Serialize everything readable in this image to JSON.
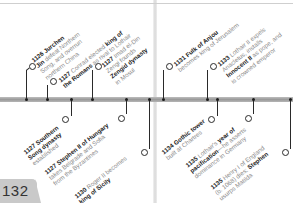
{
  "page": {
    "number": "132"
  },
  "timeline": {
    "bar_color": "#a8a8a8",
    "marker_color": "#1a1a1a"
  },
  "events": [
    {
      "id": "e1",
      "year": "1126",
      "lines": [
        [
          "b",
          "Jurchen"
        ],
        [
          "b",
          "Jin"
        ],
        [
          "n",
          " defeat Northern"
        ],
        [
          "n",
          "Song, and overrun"
        ],
        [
          "n",
          "northern China"
        ]
      ],
      "text_lines": [
        "1126 Jurchen",
        "Jin defeat Northern",
        "Song, and overrun",
        "northern China"
      ],
      "side": "above"
    },
    {
      "id": "e2",
      "year": "1127",
      "text_lines": [
        "1127 Conrad elected king of",
        "the Romans as rival to Lothair"
      ],
      "side": "above"
    },
    {
      "id": "e3",
      "year": "1127",
      "text_lines": [
        "1127 Imad el-Din",
        "Zengi founds",
        "Zengid dynasty",
        "in Mosul"
      ],
      "side": "above"
    },
    {
      "id": "e4",
      "year": "1127",
      "text_lines": [
        "1127 Southern",
        "Song dynasty",
        "established"
      ],
      "side": "below"
    },
    {
      "id": "e5",
      "year": "1127",
      "text_lines": [
        "1127 Stephen II of Hungary",
        "takes Belgrade and Sofia",
        "from the Byzantines"
      ],
      "side": "below"
    },
    {
      "id": "e6",
      "year": "1130",
      "text_lines": [
        "1130 Roger II becomes",
        "king of Sicily"
      ],
      "side": "below"
    },
    {
      "id": "e7",
      "year": "1131",
      "text_lines": [
        "1131 Fulk of Anjou",
        "becomes king of Jerusalem"
      ],
      "side": "above"
    },
    {
      "id": "e8",
      "year": "1133",
      "text_lines": [
        "1133 Lothair II expels",
        "Anacletus, installs",
        "Innocent II as pope, and",
        "is crowned emperor"
      ],
      "side": "above"
    },
    {
      "id": "e9",
      "year": "1134",
      "text_lines": [
        "1134 Gothic tower",
        "built at Chartres"
      ],
      "side": "below"
    },
    {
      "id": "e10",
      "year": "1135",
      "text_lines": [
        "1135 Lothair's year of",
        "pacification—he asserts",
        "dominance in Germany"
      ],
      "side": "below"
    },
    {
      "id": "e11",
      "year": "1135",
      "text_lines": [
        "1135 Henry I of England",
        "(b. 1068) dies; Stephen",
        "usurps Matilda"
      ],
      "side": "below"
    }
  ],
  "event_parts": {
    "e1": {
      "yr": "1126",
      "b1": "Jurchen",
      "l2b": "Jin",
      "l2": " defeat Northern",
      "l3": "Song, and overrun",
      "l4": "northern China"
    },
    "e2": {
      "yr": "1127",
      "l1": " Conrad elected ",
      "b1": "king of",
      "b2": "the Romans",
      "l2": " as rival to Lothair"
    },
    "e3": {
      "yr": "1127",
      "l1": " Imad el-Din",
      "l2": "Zengi founds",
      "b3": "Zengid dynasty",
      "l4": "in Mosul"
    },
    "e4": {
      "yr": "1127",
      "b1": " Southern",
      "b2": "Song dynasty",
      "l3": "established"
    },
    "e5": {
      "yr": "1127",
      "b1": " Stephen II of Hungary",
      "l2": "takes Belgrade and Sofia",
      "l3": "from the Byzantines"
    },
    "e6": {
      "yr": "1130",
      "l1": " Roger II becomes",
      "b2": "king of Sicily"
    },
    "e7": {
      "yr": "1131",
      "b1": " Fulk of Anjou",
      "l2": "becomes king of Jerusalem"
    },
    "e8": {
      "yr": "1133",
      "l1": " Lothair II expels",
      "l2": "Anacletus, installs",
      "b3": "Innocent II",
      "l3": " as pope, and",
      "l4": "is crowned emperor"
    },
    "e9": {
      "yr": "1134",
      "b1": " Gothic tower",
      "l2": "built at Chartres"
    },
    "e10": {
      "yr": "1135",
      "l1": " Lothair's ",
      "b1": "year of",
      "b2": "pacification",
      "l2": "—he asserts",
      "l3": "dominance in Germany"
    },
    "e11": {
      "yr": "1135",
      "l1": " Henry I of England",
      "l2": "(b. 1068) dies; ",
      "b2": "Stephen",
      "l3": "usurps Matilda"
    }
  }
}
